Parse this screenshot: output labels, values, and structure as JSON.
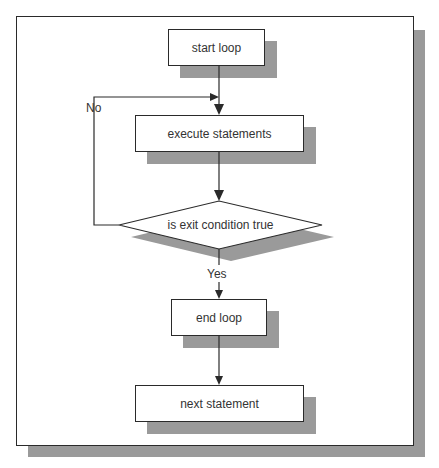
{
  "diagram": {
    "type": "flowchart",
    "title": "",
    "nodes": [
      {
        "id": "start",
        "shape": "rectangle",
        "label": "start loop"
      },
      {
        "id": "execute",
        "shape": "rectangle",
        "label": "execute statements"
      },
      {
        "id": "condition",
        "shape": "diamond",
        "label": "is exit condition true"
      },
      {
        "id": "end",
        "shape": "rectangle",
        "label": "end loop"
      },
      {
        "id": "next",
        "shape": "rectangle",
        "label": "next statement"
      }
    ],
    "edges": [
      {
        "from": "start",
        "to": "execute",
        "label": ""
      },
      {
        "from": "execute",
        "to": "condition",
        "label": ""
      },
      {
        "from": "condition",
        "to": "execute",
        "label": "No"
      },
      {
        "from": "condition",
        "to": "end",
        "label": "Yes"
      },
      {
        "from": "end",
        "to": "next",
        "label": ""
      }
    ],
    "labels": {
      "no": "No",
      "yes": "Yes"
    },
    "colors": {
      "shadow": "#9a9a9a",
      "stroke": "#2a2a2a",
      "fill": "#ffffff",
      "text": "#333333"
    }
  }
}
